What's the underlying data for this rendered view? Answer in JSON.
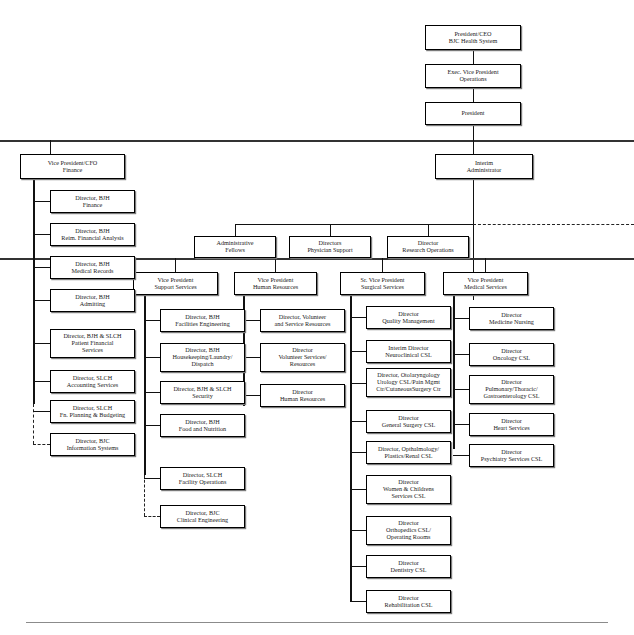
{
  "document": {
    "type": "organizational-chart",
    "title": "BJC Health System Organizational Chart"
  },
  "nodes": {
    "ceo": "President/CEO\nBJC Health System",
    "evp": "Exec. Vice President\nOperations",
    "president": "President",
    "cfo": "Vice President/CFO\nFinance",
    "interim_admin": "Interim\nAdministrator",
    "admin_fellows": "Administrative\nFellows",
    "physician_support": "Directors\nPhysician Support",
    "research_ops": "Director\nResearch Operations",
    "vp_support": "Vice President\nSupport Services",
    "vp_hr": "Vice President\nHuman Resources",
    "svp_surgical": "Sr. Vice President\nSurgical Services",
    "vp_medical": "Vice President\nMedical Services"
  },
  "finance_children": [
    "Director, BJH\nFinance",
    "Director, BJH\nReim. Financial Analysis",
    "Director, BJH\nMedical Records",
    "Director, BJH\nAdmitting",
    "Director, BJH & SLCH\nPatient Financial\nServices",
    "Director, SLCH\nAccounting Services",
    "Director, SLCH\nFn. Planning & Budgeting",
    "Director, BJC\nInformation Systems"
  ],
  "support_children": [
    "Director, BJH\nFacilities Engineering",
    "Director, BJH\nHousekeeping/Laundry/\nDispatch",
    "Director, BJH & SLCH\nSecurity",
    "Director, BJH\nFood and Nutrition",
    "Director, SLCH\nFacility Operations",
    "Director, BJC\nClinical Engineering"
  ],
  "hr_children": [
    "Director, Volunteer\nand Service Resources",
    "Director\nVolunteer Services/\nResources",
    "Director\nHuman Resources"
  ],
  "surgical_children": [
    "Director\nQuality Management",
    "Interim Director\nNeuroclinical CSL",
    "Director, Otolaryngology\nUrology CSL/Pain Mgmt\nCtr/CutaneousSurgery Ctr",
    "Director\nGeneral Surgery CSL",
    "Director, Opthalmology/\nPlastics/Renal CSL",
    "Director\nWomen & Childrens\nServices CSL",
    "Director\nOrthopedics CSL/\nOperating Rooms",
    "Director\nDentistry CSL",
    "Director\nRehabilitation CSL"
  ],
  "medical_children": [
    "Director\nMedicine Nursing",
    "Director\nOncology CSL",
    "Director\nPulmonary/Thoracic/\nGastroenterology CSL",
    "Director\nHeart Services",
    "Director\nPsychiatry Services CSL"
  ],
  "colors": {
    "line": "#111111",
    "box_border": "#000000",
    "box_fill": "#ffffff",
    "shadow": "#7a7a7a",
    "baseline": "#8b8b8b",
    "background": "#ffffff"
  }
}
